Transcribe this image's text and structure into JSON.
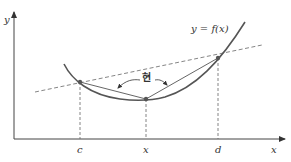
{
  "diagram": {
    "type": "convex-function-secant",
    "axes": {
      "x_label": "x",
      "y_label": "y"
    },
    "curve_label": "y = f(x)",
    "chord_label": "현",
    "tick_labels": {
      "c": "c",
      "x": "x",
      "d": "d"
    },
    "points": [
      {
        "name": "c",
        "on": "curve and chord"
      },
      {
        "name": "x",
        "on": "curve"
      },
      {
        "name": "d",
        "on": "curve and chord"
      }
    ],
    "colors": {
      "curve": "#555555",
      "axis": "#444444",
      "dashed": "#666666",
      "point": "#555555"
    }
  }
}
